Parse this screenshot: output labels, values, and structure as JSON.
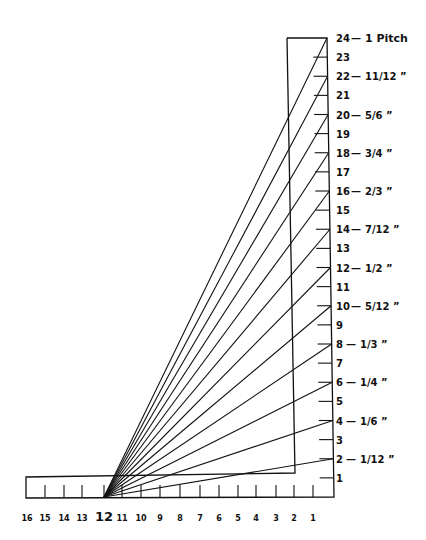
{
  "diagram": {
    "stroke_color": "#111111",
    "background_color": "#ffffff",
    "rise_scale": {
      "min": 0,
      "max": 24,
      "ticks": [
        {
          "value": 24,
          "label": "24",
          "pitch": "1 Pitch"
        },
        {
          "value": 23,
          "label": "23",
          "pitch": ""
        },
        {
          "value": 22,
          "label": "22",
          "pitch": "11/12 ”"
        },
        {
          "value": 21,
          "label": "21",
          "pitch": ""
        },
        {
          "value": 20,
          "label": "20",
          "pitch": "5/6 ”"
        },
        {
          "value": 19,
          "label": "19",
          "pitch": ""
        },
        {
          "value": 18,
          "label": "18",
          "pitch": "3/4 ”"
        },
        {
          "value": 17,
          "label": "17",
          "pitch": ""
        },
        {
          "value": 16,
          "label": "16",
          "pitch": "2/3 ”"
        },
        {
          "value": 15,
          "label": "15",
          "pitch": ""
        },
        {
          "value": 14,
          "label": "14",
          "pitch": "7/12 ”"
        },
        {
          "value": 13,
          "label": "13",
          "pitch": ""
        },
        {
          "value": 12,
          "label": "12",
          "pitch": "1/2 ”"
        },
        {
          "value": 11,
          "label": "11",
          "pitch": ""
        },
        {
          "value": 10,
          "label": "10",
          "pitch": "5/12 ”"
        },
        {
          "value": 9,
          "label": "9",
          "pitch": ""
        },
        {
          "value": 8,
          "label": "8",
          "pitch": "1/3 ”"
        },
        {
          "value": 7,
          "label": "7",
          "pitch": ""
        },
        {
          "value": 6,
          "label": "6",
          "pitch": "1/4 ”"
        },
        {
          "value": 5,
          "label": "5",
          "pitch": ""
        },
        {
          "value": 4,
          "label": "4",
          "pitch": "1/6 ”"
        },
        {
          "value": 3,
          "label": "3",
          "pitch": ""
        },
        {
          "value": 2,
          "label": "2",
          "pitch": "1/12 ”"
        },
        {
          "value": 1,
          "label": "1",
          "pitch": ""
        }
      ]
    },
    "run_scale": {
      "pivot_value": 12,
      "labels": [
        "16",
        "15",
        "14",
        "13",
        "12",
        "11",
        "10",
        "9",
        "8",
        "7",
        "6",
        "5",
        "4",
        "3",
        "2",
        "1"
      ]
    },
    "fan_lines_rise_values": [
      2,
      4,
      6,
      8,
      10,
      12,
      14,
      16,
      18,
      20,
      22,
      24
    ],
    "pitch_separator": "—"
  }
}
